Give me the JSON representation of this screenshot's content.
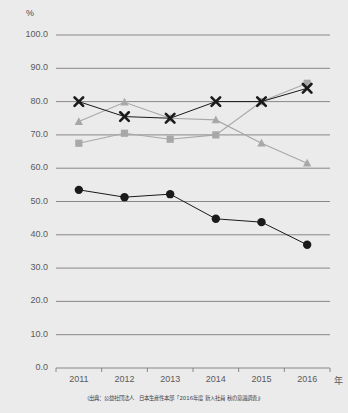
{
  "axis": {
    "y_unit": "%",
    "x_unit": "年",
    "y_ticks": [
      "100.0",
      "90.0",
      "80.0",
      "70.0",
      "60.0",
      "50.0",
      "40.0",
      "30.0",
      "20.0",
      "10.0",
      "0.0"
    ],
    "x_ticks": [
      "2011",
      "2012",
      "2013",
      "2014",
      "2015",
      "2016"
    ]
  },
  "caption": {
    "text": "(出典：公益社団法人　日本生産性本部「2016年度 新入社員 秋の意識調査」)"
  },
  "colors": {
    "background": "#ebebeb",
    "gridline": "#6e6e6e",
    "series_dark": "#1a1a1a",
    "series_gray": "#a8a8a8"
  },
  "chart_data": {
    "type": "line",
    "title": "",
    "xlabel": "年",
    "ylabel": "%",
    "ylim": [
      0,
      100
    ],
    "grid": true,
    "legend_position": "none",
    "categories": [
      "2011",
      "2012",
      "2013",
      "2014",
      "2015",
      "2016"
    ],
    "series": [
      {
        "name": "series-x-dark",
        "marker": "x",
        "color": "#1a1a1a",
        "values": [
          80.0,
          75.5,
          75.0,
          80.0,
          80.0,
          84.0
        ]
      },
      {
        "name": "series-square-gray",
        "marker": "square",
        "color": "#a8a8a8",
        "values": [
          67.5,
          70.5,
          68.7,
          70.0,
          80.0,
          85.5
        ]
      },
      {
        "name": "series-triangle-gray",
        "marker": "triangle",
        "color": "#a8a8a8",
        "values": [
          74.0,
          79.8,
          75.0,
          74.5,
          67.5,
          61.5
        ]
      },
      {
        "name": "series-circle-dark",
        "marker": "circle",
        "color": "#1a1a1a",
        "values": [
          53.5,
          51.3,
          52.2,
          44.8,
          43.8,
          37.0
        ]
      }
    ]
  }
}
